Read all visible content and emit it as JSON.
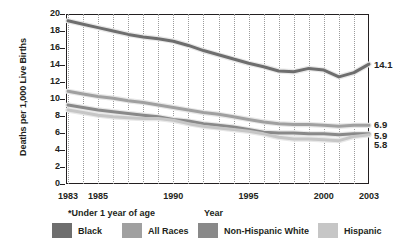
{
  "chart_data": {
    "type": "line",
    "title": "",
    "xlabel": "Year",
    "ylabel": "Deaths per 1,000 Live Births",
    "footnote": "*Under 1 year of age",
    "xlim": [
      1983,
      2003
    ],
    "ylim": [
      0,
      20
    ],
    "ytick_step": 2,
    "yticks": [
      "20",
      "18",
      "16",
      "14",
      "12",
      "10",
      "8",
      "6",
      "4",
      "2",
      "0"
    ],
    "xticks": [
      "1983",
      "1985",
      "1990",
      "1995",
      "2000",
      "2003"
    ],
    "xtick_values": [
      1983,
      1985,
      1990,
      1995,
      2000,
      2003
    ],
    "gridlines": "vertical dotted at every year",
    "legend_position": "bottom",
    "x": [
      1983,
      1984,
      1985,
      1986,
      1987,
      1988,
      1989,
      1990,
      1991,
      1992,
      1993,
      1994,
      1995,
      1996,
      1997,
      1998,
      1999,
      2000,
      2001,
      2002,
      2003
    ],
    "series": [
      {
        "name": "Black",
        "color": "#6e6e6e",
        "end_label": "14.1",
        "values": [
          19.2,
          18.8,
          18.4,
          18.0,
          17.6,
          17.3,
          17.1,
          16.8,
          16.3,
          15.7,
          15.2,
          14.7,
          14.2,
          13.8,
          13.3,
          13.2,
          13.6,
          13.4,
          12.6,
          13.1,
          14.1
        ]
      },
      {
        "name": "All Races",
        "color": "#a0a0a0",
        "end_label": "6.9",
        "values": [
          10.9,
          10.6,
          10.3,
          10.1,
          9.8,
          9.6,
          9.3,
          9.0,
          8.7,
          8.4,
          8.2,
          7.9,
          7.6,
          7.3,
          7.1,
          7.0,
          7.0,
          6.9,
          6.8,
          6.9,
          6.9
        ]
      },
      {
        "name": "Non-Hispanic White",
        "color": "#898989",
        "end_label": "5.9",
        "values": [
          9.3,
          9.0,
          8.7,
          8.5,
          8.3,
          8.1,
          7.9,
          7.6,
          7.4,
          7.1,
          6.9,
          6.7,
          6.4,
          6.1,
          6.0,
          6.0,
          5.9,
          5.9,
          5.8,
          5.9,
          5.9
        ]
      },
      {
        "name": "Hispanic",
        "color": "#c6c6c6",
        "end_label": "5.8",
        "values": [
          8.7,
          8.4,
          8.1,
          7.9,
          7.8,
          7.7,
          7.7,
          7.5,
          7.1,
          6.8,
          6.6,
          6.4,
          6.2,
          5.9,
          5.5,
          5.3,
          5.3,
          5.2,
          5.1,
          5.6,
          5.8
        ]
      }
    ]
  },
  "legend": {
    "items": [
      {
        "label": "Black",
        "color": "#6e6e6e"
      },
      {
        "label": "All Races",
        "color": "#a0a0a0"
      },
      {
        "label": "Non-Hispanic White",
        "color": "#898989"
      },
      {
        "label": "Hispanic",
        "color": "#c6c6c6"
      }
    ]
  },
  "end_labels": [
    {
      "text": "14.1",
      "value": 14.1
    },
    {
      "text": "6.9",
      "value": 6.9
    },
    {
      "text": "5.9",
      "value": 5.9
    },
    {
      "text": "5.8",
      "value": 5.8
    }
  ]
}
